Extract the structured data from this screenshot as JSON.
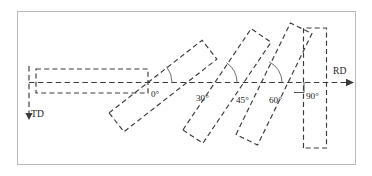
{
  "figure": {
    "type": "schematic-diagram",
    "frame": {
      "x": 17,
      "y": 11,
      "width": 339,
      "height": 154,
      "stroke": "#b9b9b9",
      "fill": "#ffffff"
    },
    "colors": {
      "outline": "#3a3a3a",
      "arc": "#555555",
      "text": "#1c1c1c",
      "frame": "#b9b9b9",
      "background": "#ffffff"
    },
    "axes": {
      "rolling_direction": {
        "label": "RD",
        "label_x": 333,
        "label_y": 74,
        "line": {
          "x1": 29,
          "y1": 82.5,
          "x2": 346,
          "y2": 82.5
        },
        "arrow_tip_x": 354,
        "orientation": "horizontal-right"
      },
      "transverse_direction": {
        "label": "TD",
        "label_x": 31,
        "label_y": 117,
        "line": {
          "x1": 29,
          "y1": 66,
          "x2": 29,
          "y2": 112
        },
        "arrow_tip_y": 120,
        "orientation": "vertical-down"
      }
    },
    "specimens": [
      {
        "angle_label": "0°",
        "angle_deg": 0,
        "label_x": 151,
        "label_y": 97,
        "rect": {
          "cx": 92,
          "cy": 81,
          "length": 112,
          "width": 24,
          "rotation": 0
        },
        "arc": null
      },
      {
        "angle_label": "30°",
        "angle_deg": 30,
        "label_x": 196,
        "label_y": 101,
        "rect": {
          "cx": 163,
          "cy": 86,
          "length": 118,
          "width": 24,
          "rotation": -38
        },
        "arc": {
          "cx": 146,
          "cy": 82.5,
          "radius": 26,
          "start_deg": 0,
          "end_deg": -38
        }
      },
      {
        "angle_label": "45°",
        "angle_deg": 45,
        "label_x": 236,
        "label_y": 103,
        "rect": {
          "cx": 227,
          "cy": 86,
          "length": 122,
          "width": 24,
          "rotation": -56
        },
        "arc": {
          "cx": 213,
          "cy": 82.5,
          "radius": 24,
          "start_deg": 0,
          "end_deg": -56
        }
      },
      {
        "angle_label": "60°",
        "angle_deg": 60,
        "label_x": 269,
        "label_y": 103,
        "rect": {
          "cx": 274,
          "cy": 84,
          "length": 124,
          "width": 24,
          "rotation": -64
        },
        "arc": {
          "cx": 259,
          "cy": 82.5,
          "radius": 23,
          "start_deg": 0,
          "end_deg": -64
        }
      },
      {
        "angle_label": "90°",
        "angle_deg": 90,
        "label_x": 306,
        "label_y": 99,
        "rect": {
          "cx": 315,
          "cy": 88,
          "length": 120,
          "width": 23,
          "rotation": -90
        },
        "arc": null,
        "right_angle_marker": {
          "x": 304,
          "y": 82.5,
          "size": 10
        }
      }
    ]
  }
}
